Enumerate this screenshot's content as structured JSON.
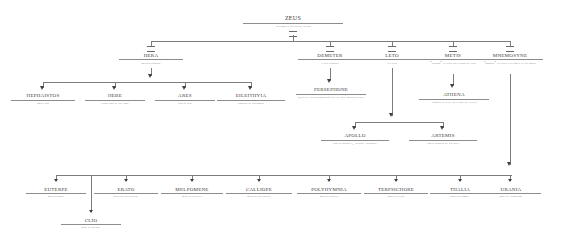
{
  "diagram": {
    "line_color": "#7c7c7c",
    "name_color": "#3b3b3b",
    "desc_color": "#6d6d6d",
    "marriage_symbol": "="
  },
  "root": {
    "name": "Zeus",
    "desc": "and some of his divine lovers"
  },
  "consorts": [
    {
      "name": "Hera",
      "desc": "mother goddess"
    },
    {
      "name": "Demeter",
      "desc": "earth goddess"
    },
    {
      "name": "Leto",
      "desc": "titaness"
    },
    {
      "name": "Metis",
      "desc": "“wisdom” titaness swallowed by Zeus"
    },
    {
      "name": "Mnemosyne",
      "desc": "“memory” titaness gave birth to the Muses"
    }
  ],
  "hera_children": [
    {
      "name": "Hephaistos",
      "desc": "smith god"
    },
    {
      "name": "Hebe",
      "desc": "cupbearer of the gods"
    },
    {
      "name": "Ares",
      "desc": "god of war"
    },
    {
      "name": "Eileithyia",
      "desc": "goddess of childbirth"
    }
  ],
  "demeter_children": [
    {
      "name": "Persephone",
      "desc": "queen of the underworld; wife of Zeus' brother Hades"
    }
  ],
  "metis_children": [
    {
      "name": "Athena",
      "desc": "goddess of war and patron of Athens"
    }
  ],
  "leto_children": [
    {
      "name": "Apollo",
      "desc": "god of prophecy, archery and music"
    },
    {
      "name": "Artemis",
      "desc": "virgin goddess of the hunt"
    }
  ],
  "muses": [
    {
      "name": "Euterpe",
      "desc": "muse of music"
    },
    {
      "name": "Erato",
      "desc": "muse of love poetry"
    },
    {
      "name": "Melpomene",
      "desc": "muse of tragedy"
    },
    {
      "name": "Calliope",
      "desc": "muse of epic poetry"
    },
    {
      "name": "Polyhymnia",
      "desc": "muse of singing"
    },
    {
      "name": "Terpsichore",
      "desc": "muse of dance"
    },
    {
      "name": "Thalia",
      "desc": "muse of comedy"
    },
    {
      "name": "Urania",
      "desc": "muse of astronomy"
    },
    {
      "name": "Clio",
      "desc": "muse of history"
    }
  ]
}
